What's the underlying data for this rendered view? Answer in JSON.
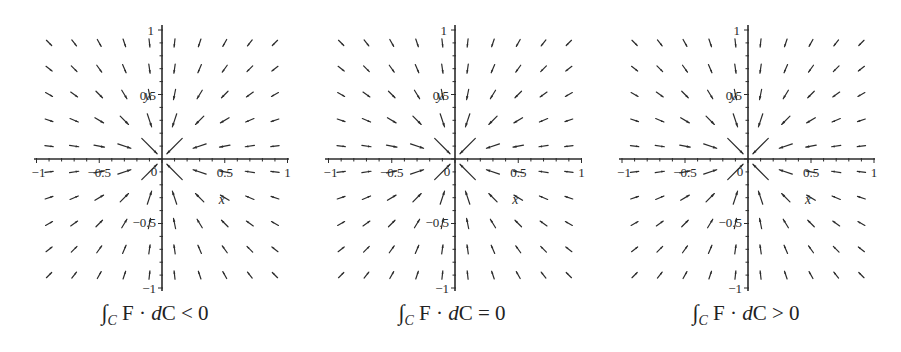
{
  "chart_data": [
    {
      "type": "quiver",
      "title": "",
      "caption": {
        "integral": "∫",
        "subscript": "C",
        "integrand": "F · ",
        "d": "d",
        "curve": "C",
        "relation": "<",
        "value": "0"
      },
      "xlabel": "x",
      "ylabel": "y",
      "xlim": [
        -1,
        1
      ],
      "ylim": [
        -1,
        1
      ],
      "xticks": [
        "−1",
        "−0.5",
        "0",
        "0.5",
        "1"
      ],
      "yticks": [
        "1",
        "0.5",
        "−0.5",
        "−1"
      ],
      "grid": false,
      "field": "F(x,y) = −(x,y)/(x²+y²) (sink toward origin, scaled arrows)",
      "sample_points": [
        -0.9,
        -0.7,
        -0.5,
        -0.3,
        -0.1,
        0.1,
        0.3,
        0.5,
        0.7,
        0.9
      ]
    },
    {
      "type": "quiver",
      "title": "",
      "caption": {
        "integral": "∫",
        "subscript": "C",
        "integrand": "F · ",
        "d": "d",
        "curve": "C",
        "relation": "=",
        "value": "0"
      },
      "xlabel": "x",
      "ylabel": "y",
      "xlim": [
        -1,
        1
      ],
      "ylim": [
        -1,
        1
      ],
      "xticks": [
        "−1",
        "−0.5",
        "0",
        "0.5",
        "1"
      ],
      "yticks": [
        "1",
        "0.5",
        "−0.5",
        "−1"
      ],
      "grid": false,
      "field": "F(x,y) = −(x,y)/(x²+y²) (sink toward origin, scaled arrows)",
      "sample_points": [
        -0.9,
        -0.7,
        -0.5,
        -0.3,
        -0.1,
        0.1,
        0.3,
        0.5,
        0.7,
        0.9
      ]
    },
    {
      "type": "quiver",
      "title": "",
      "caption": {
        "integral": "∫",
        "subscript": "C",
        "integrand": "F · ",
        "d": "d",
        "curve": "C",
        "relation": ">",
        "value": "0"
      },
      "xlabel": "x",
      "ylabel": "y",
      "xlim": [
        -1,
        1
      ],
      "ylim": [
        -1,
        1
      ],
      "xticks": [
        "−1",
        "−0.5",
        "0",
        "0.5",
        "1"
      ],
      "yticks": [
        "1",
        "0.5",
        "−0.5",
        "−1"
      ],
      "grid": false,
      "field": "F(x,y) = −(x,y)/(x²+y²) (sink toward origin, scaled arrows)",
      "sample_points": [
        -0.9,
        -0.7,
        -0.5,
        -0.3,
        -0.1,
        0.1,
        0.3,
        0.5,
        0.7,
        0.9
      ]
    }
  ],
  "panels": [
    {
      "left": 0,
      "x0": 36,
      "x1": 287,
      "yTop": 29,
      "yBot": 287,
      "axisX": 162,
      "axisY": 159
    },
    {
      "left": 0,
      "x0": 327,
      "x1": 580,
      "yTop": 29,
      "yBot": 287,
      "axisX": 455,
      "axisY": 159
    },
    {
      "left": 0,
      "x0": 621,
      "x1": 873,
      "yTop": 29,
      "yBot": 287,
      "axisX": 748,
      "axisY": 159
    }
  ],
  "style": {
    "ink": "#2b2b2b",
    "background": "#ffffff"
  }
}
